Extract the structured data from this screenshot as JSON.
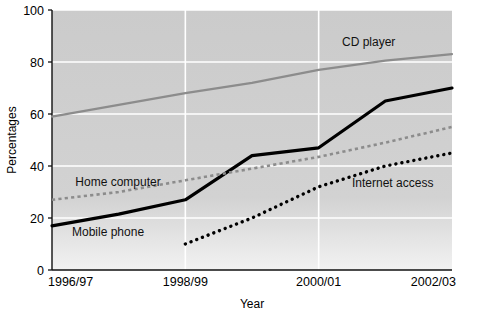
{
  "chart_data": {
    "type": "line",
    "title": "",
    "xlabel": "Year",
    "ylabel": "Percentages",
    "categories": [
      "1996/97",
      "1997/98",
      "1998/99",
      "1999/00",
      "2000/01",
      "2001/02",
      "2002/03"
    ],
    "x": [
      1996,
      1997,
      1998,
      1999,
      2000,
      2001,
      2002
    ],
    "xtick_labels": [
      "1996/97",
      "1998/99",
      "2000/01",
      "2002/03"
    ],
    "xtick_values": [
      1996,
      1998,
      2000,
      2002
    ],
    "ytick_labels": [
      "0",
      "20",
      "40",
      "60",
      "80",
      "100"
    ],
    "ytick_values": [
      0,
      20,
      40,
      60,
      80,
      100
    ],
    "ylim": [
      0,
      100
    ],
    "xlim": [
      1996,
      2002
    ],
    "grid": "white gridlines on grey plot background",
    "legend": "inline data labels next to each line",
    "series": [
      {
        "name": "CD player",
        "style": "solid",
        "color": "#8c8c8c",
        "width": 2.2,
        "label_x": 2000.35,
        "label_y": 86,
        "x": [
          1996,
          1997,
          1998,
          1999,
          2000,
          2001,
          2002
        ],
        "values": [
          59,
          63.5,
          68,
          72,
          77,
          80.5,
          83
        ]
      },
      {
        "name": "Mobile phone",
        "style": "solid",
        "color": "#000000",
        "width": 3.2,
        "label_x": 1996.3,
        "label_y": 13,
        "x": [
          1996,
          1997,
          1998,
          1999,
          2000,
          2001,
          2002
        ],
        "values": [
          17,
          21.5,
          27,
          44,
          47,
          65,
          70
        ]
      },
      {
        "name": "Home computer",
        "style": "dashed",
        "color": "#8c8c8c",
        "width": 2.6,
        "label_x": 1996.35,
        "label_y": 32.5,
        "x": [
          1996,
          1997,
          1998,
          1999,
          2000,
          2001,
          2002
        ],
        "values": [
          27,
          30,
          34.5,
          39,
          43.5,
          49,
          55
        ]
      },
      {
        "name": "Internet access",
        "style": "dotted",
        "color": "#000000",
        "width": 3.4,
        "label_x": 2000.5,
        "label_y": 32,
        "x": [
          1998,
          1999,
          2000,
          2001,
          2002
        ],
        "values": [
          10,
          20,
          32,
          40,
          45
        ]
      }
    ]
  },
  "axes": {
    "y_axis_title": "Percentages",
    "x_axis_title": "Year"
  }
}
